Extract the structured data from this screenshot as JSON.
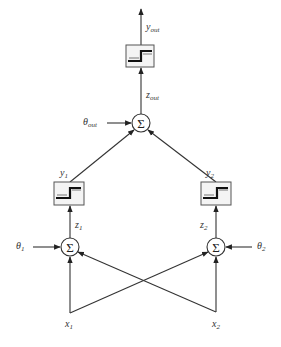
{
  "diagram": {
    "type": "feedforward-neural-network",
    "layers": [
      "input",
      "hidden",
      "output"
    ],
    "inputs": [
      {
        "id": "x1",
        "label": "x",
        "sub": "1"
      },
      {
        "id": "x2",
        "label": "x",
        "sub": "2"
      }
    ],
    "hidden": [
      {
        "id": "n1",
        "sum_symbol": "Σ",
        "bias_label": "θ",
        "bias_sub": "1",
        "net_label": "z",
        "net_sub": "1",
        "out_label": "y",
        "out_sub": "1"
      },
      {
        "id": "n2",
        "sum_symbol": "Σ",
        "bias_label": "θ",
        "bias_sub": "2",
        "net_label": "z",
        "net_sub": "2",
        "out_label": "y",
        "out_sub": "2"
      }
    ],
    "output": {
      "id": "nout",
      "sum_symbol": "Σ",
      "bias_label": "θ",
      "bias_sub": "out",
      "net_label": "z",
      "net_sub": "out",
      "out_label": "y",
      "out_sub": "out"
    },
    "activation": "step-function",
    "edges": [
      [
        "x1",
        "n1"
      ],
      [
        "x1",
        "n2"
      ],
      [
        "x2",
        "n1"
      ],
      [
        "x2",
        "n2"
      ],
      [
        "n1",
        "nout"
      ],
      [
        "n2",
        "nout"
      ]
    ],
    "colors": {
      "line": "#333333",
      "box_fill": "#f4f4f4",
      "background": "#ffffff"
    }
  },
  "caption_fragment": ""
}
